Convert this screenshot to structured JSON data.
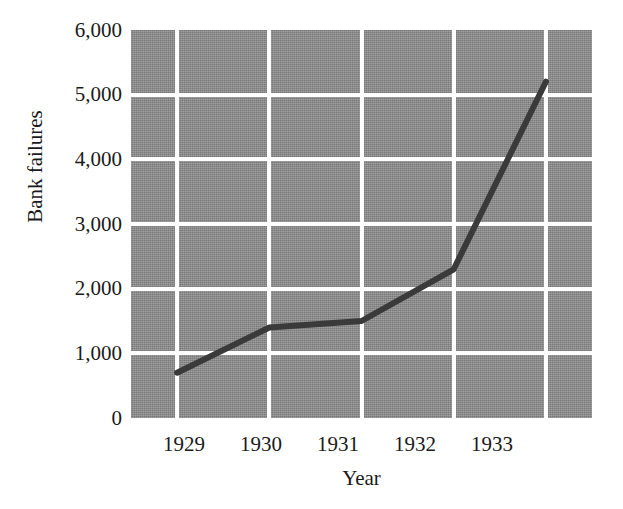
{
  "chart_data": {
    "type": "line",
    "title": "",
    "subtitle": "",
    "xlabel": "Year",
    "ylabel": "Bank failures",
    "x": [
      1929,
      1930,
      1931,
      1932,
      1933
    ],
    "categories": [
      "1929",
      "1930",
      "1931",
      "1932",
      "1933"
    ],
    "values": [
      700,
      1400,
      1500,
      2300,
      5200
    ],
    "series": [
      {
        "name": "Bank failures",
        "values": [
          700,
          1400,
          1500,
          2300,
          5200
        ]
      }
    ],
    "xlim": [
      1928.5,
      1933.5
    ],
    "ylim": [
      0,
      6000
    ],
    "ytick_labels": [
      "0",
      "1,000",
      "2,000",
      "3,000",
      "4,000",
      "5,000",
      "6,000"
    ],
    "ytick_values": [
      0,
      1000,
      2000,
      3000,
      4000,
      5000,
      6000
    ],
    "xtick_labels": [
      "1929",
      "1930",
      "1931",
      "1932",
      "1933"
    ],
    "grid": "white gridlines on gray panel, horizontal and vertical",
    "legend": "none",
    "annotations": [],
    "colors": {
      "plot_background": "#8a8a8a",
      "gridline": "#ffffff",
      "line": "#3a3a3a",
      "text": "#1a1a1a",
      "figure_background": "#ffffff"
    }
  }
}
